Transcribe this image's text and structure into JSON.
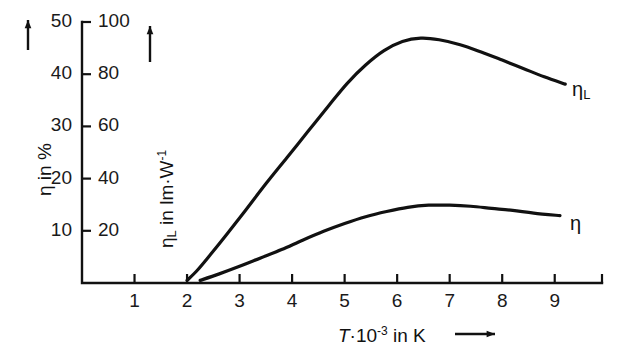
{
  "chart_data": {
    "type": "line",
    "title": "",
    "xlabel": "T·10⁻³ in K",
    "xlabel_parts": {
      "symbol": "T",
      "dot": "·",
      "base": "10",
      "exponent": "-3",
      "unit": "in K"
    },
    "xticks": [
      1,
      2,
      3,
      4,
      5,
      6,
      7,
      8,
      9
    ],
    "xlim": [
      0,
      9.9
    ],
    "grid": false,
    "legend_position": "inline-right",
    "axes": [
      {
        "id": "left",
        "label": "η in %",
        "label_parts": {
          "symbol": "η",
          "text": "in %"
        },
        "ticks": [
          10,
          20,
          30,
          40,
          50
        ],
        "ylim": [
          0,
          50
        ],
        "arrow": true
      },
      {
        "id": "inner",
        "label": "ηₗ in lm·W⁻¹",
        "label_parts": {
          "symbol": "η",
          "subscript": "L",
          "text": "in lm·W",
          "exponent": "-1"
        },
        "ticks": [
          20,
          40,
          60,
          80,
          100
        ],
        "ylim": [
          0,
          100
        ],
        "arrow": true
      }
    ],
    "series": [
      {
        "name": "η_L",
        "label": "η",
        "label_subscript": "L",
        "axis": "inner",
        "unit": "lm·W⁻¹",
        "points": [
          [
            2.0,
            1.0
          ],
          [
            2.2,
            5.0
          ],
          [
            2.45,
            11.0
          ],
          [
            2.75,
            18.5
          ],
          [
            3.1,
            27.5
          ],
          [
            3.5,
            38.0
          ],
          [
            3.9,
            48.0
          ],
          [
            4.3,
            58.0
          ],
          [
            4.7,
            68.0
          ],
          [
            5.05,
            76.5
          ],
          [
            5.4,
            83.5
          ],
          [
            5.75,
            89.0
          ],
          [
            6.1,
            92.5
          ],
          [
            6.45,
            93.8
          ],
          [
            6.8,
            93.2
          ],
          [
            7.2,
            91.3
          ],
          [
            7.6,
            88.5
          ],
          [
            8.0,
            85.4
          ],
          [
            8.4,
            82.2
          ],
          [
            8.8,
            79.0
          ],
          [
            9.2,
            76.2
          ]
        ]
      },
      {
        "name": "η",
        "label": "η",
        "label_subscript": "",
        "axis": "left",
        "unit": "%",
        "points": [
          [
            2.25,
            0.5
          ],
          [
            2.6,
            1.7
          ],
          [
            3.0,
            3.2
          ],
          [
            3.4,
            4.8
          ],
          [
            3.8,
            6.4
          ],
          [
            4.2,
            8.2
          ],
          [
            4.6,
            9.9
          ],
          [
            5.0,
            11.4
          ],
          [
            5.4,
            12.7
          ],
          [
            5.8,
            13.7
          ],
          [
            6.2,
            14.5
          ],
          [
            6.6,
            14.9
          ],
          [
            7.0,
            14.9
          ],
          [
            7.4,
            14.7
          ],
          [
            7.8,
            14.3
          ],
          [
            8.2,
            13.9
          ],
          [
            8.6,
            13.4
          ],
          [
            9.1,
            12.9
          ]
        ]
      }
    ]
  },
  "geometry": {
    "note": "pixel mapping used by template only"
  }
}
